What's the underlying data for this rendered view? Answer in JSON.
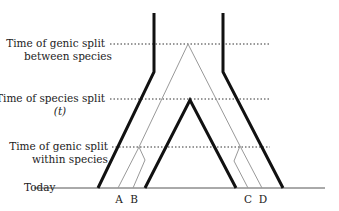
{
  "diagram": {
    "labels": {
      "genic_split_between_line1": "Time of genic split",
      "genic_split_between_line2": "between species",
      "species_split_line1": "Time of species split",
      "species_split_line2": "(t)",
      "genic_split_within_line1": "Time of genic split",
      "genic_split_within_line2": "within species",
      "today": "Today"
    },
    "leaves": [
      "A",
      "B",
      "C",
      "D"
    ],
    "colors": {
      "species_tree": "#111111",
      "gene_tree": "#999999",
      "guide_lines": "#333333"
    }
  }
}
